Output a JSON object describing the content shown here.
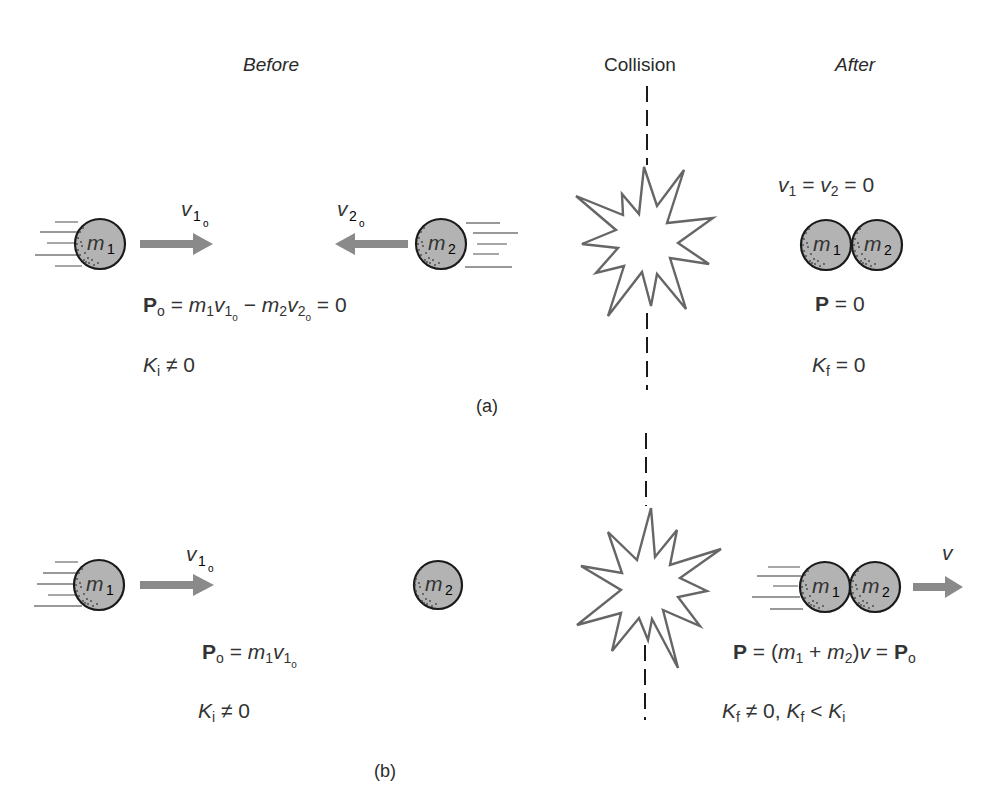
{
  "headers": {
    "before": "Before",
    "collision": "Collision",
    "after": "After"
  },
  "panel_a": {
    "caption": "(a)",
    "ball1": {
      "m": "m",
      "sub": "1"
    },
    "ball2": {
      "m": "m",
      "sub": "2"
    },
    "v1o": {
      "v": "v",
      "sub": "1",
      "subsub": "o"
    },
    "v2o": {
      "v": "v",
      "sub": "2",
      "subsub": "o"
    },
    "momentum_eq": {
      "P": "P",
      "P_sub": "o",
      "eq1": " = ",
      "m1": "m",
      "m1_sub": "1",
      "v1": "v",
      "v1_sub": "1",
      "v1_subsub": "o",
      "minus": " − ",
      "m2": "m",
      "m2_sub": "2",
      "v2": "v",
      "v2_sub": "2",
      "v2_subsub": "o",
      "eq2": " = 0"
    },
    "ki_eq": {
      "K": "K",
      "sub": "i",
      "rest": " ≠ 0"
    },
    "after_velocity_eq": {
      "v1": "v",
      "v1_sub": "1",
      "mid": " = ",
      "v2": "v",
      "v2_sub": "2",
      "rest": " = 0"
    },
    "after_momentum_eq": {
      "P": "P",
      "rest": " = 0"
    },
    "kf_eq": {
      "K": "K",
      "sub": "f",
      "rest": " = 0"
    },
    "combined_ball1": {
      "m": "m",
      "sub": "1"
    },
    "combined_ball2": {
      "m": "m",
      "sub": "2"
    }
  },
  "panel_b": {
    "caption": "(b)",
    "ball1": {
      "m": "m",
      "sub": "1"
    },
    "ball2": {
      "m": "m",
      "sub": "2"
    },
    "v1o": {
      "v": "v",
      "sub": "1",
      "subsub": "o"
    },
    "momentum_eq": {
      "P": "P",
      "P_sub": "o",
      "eq": " = ",
      "m1": "m",
      "m1_sub": "1",
      "v1": "v",
      "v1_sub": "1",
      "v1_subsub": "o"
    },
    "ki_eq": {
      "K": "K",
      "sub": "i",
      "rest": " ≠ 0"
    },
    "combined_ball1": {
      "m": "m",
      "sub": "1"
    },
    "combined_ball2": {
      "m": "m",
      "sub": "2"
    },
    "v_final": "v",
    "after_momentum_eq": {
      "P": "P",
      "open": " = (",
      "m1": "m",
      "m1_sub": "1",
      "plus": " + ",
      "m2": "m",
      "m2_sub": "2",
      "close": ")",
      "v": "v",
      "eq": " = ",
      "P2": "P",
      "P2_sub": "o"
    },
    "kf_eq": {
      "K": "K",
      "sub": "f",
      "mid": " ≠ 0, ",
      "K2": "K",
      "sub2": "f",
      "lt": " < ",
      "K3": "K",
      "sub3": "i"
    }
  },
  "colors": {
    "ball_fill": "#b3b3b3",
    "arrow": "#8a8a8a",
    "outline": "#1a1a1a"
  }
}
